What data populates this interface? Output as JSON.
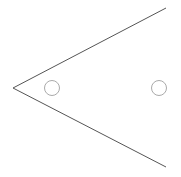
{
  "diagram": {
    "background": "#ffffff",
    "line_color": "#555555",
    "circle_color": "#aaaaaa",
    "vertex": {
      "x": 13,
      "y": 88
    },
    "rays": [
      {
        "name": "upper-ray",
        "x2": 166,
        "y2": 8
      },
      {
        "name": "lower-ray",
        "x2": 166,
        "y2": 167
      }
    ],
    "circles": [
      {
        "name": "inner-circle",
        "cx": 52,
        "cy": 88,
        "r": 7.5
      },
      {
        "name": "outer-circle",
        "cx": 159,
        "cy": 88,
        "r": 7.5
      }
    ]
  }
}
